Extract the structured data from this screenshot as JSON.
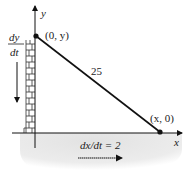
{
  "diagram": {
    "type": "related-rates-ladder",
    "axes": {
      "x_label": "x",
      "y_label": "y"
    },
    "points": {
      "top": "(0, y)",
      "bottom": "(x, 0)"
    },
    "ladder_length_label": "25",
    "rates": {
      "vertical_numerator": "dy",
      "vertical_denominator": "dt",
      "horizontal": "dx/dt = 2"
    },
    "colors": {
      "line": "#111111",
      "ground_shade": "#e6e6e6",
      "brick": "#333333"
    }
  }
}
